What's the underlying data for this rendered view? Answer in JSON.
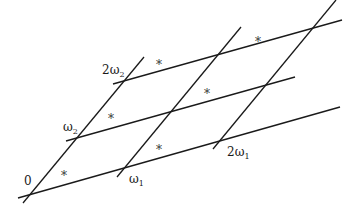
{
  "diagram": {
    "labels": {
      "origin": "0",
      "omega1": "ω",
      "omega1_sub": "1",
      "omega2": "ω",
      "omega2_sub": "2",
      "two_omega1_coef": "2ω",
      "two_omega1_sub": "1",
      "two_omega2_coef": "2ω",
      "two_omega2_sub": "2"
    },
    "star_symbol": "*",
    "star_count": 6,
    "colors": {
      "line": "#1a1a1a",
      "text": "#1a1a1a",
      "background": "#ffffff"
    }
  }
}
